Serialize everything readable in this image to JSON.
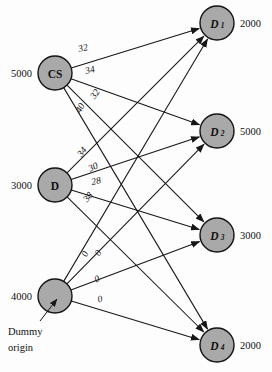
{
  "figure": {
    "type": "network-diagram",
    "background_color": "#fdfdfd",
    "node_fill_color": "#a9a9a9",
    "node_stroke_color": "#141414",
    "edge_color": "#161616"
  },
  "origins": [
    {
      "id": "CS",
      "label": "CS",
      "label_style": "upright",
      "supply": "5000",
      "cx": 55,
      "cy": 73,
      "r": 17
    },
    {
      "id": "D",
      "label": "D",
      "label_style": "upright",
      "supply": "3000",
      "cx": 55,
      "cy": 185,
      "r": 17
    },
    {
      "id": "DUMMY",
      "label": "",
      "label_style": "none",
      "supply": "4000",
      "cx": 55,
      "cy": 296,
      "r": 17
    }
  ],
  "destinations": [
    {
      "id": "D1",
      "label": "D",
      "subscript": "1",
      "demand": "2000",
      "cx": 217,
      "cy": 23,
      "r": 17
    },
    {
      "id": "D2",
      "label": "D",
      "subscript": "2",
      "demand": "5000",
      "cx": 217,
      "cy": 131,
      "r": 17
    },
    {
      "id": "D3",
      "label": "D",
      "subscript": "3",
      "demand": "3000",
      "cx": 217,
      "cy": 235,
      "r": 17
    },
    {
      "id": "D4",
      "label": "D",
      "subscript": "4",
      "demand": "2000",
      "cx": 217,
      "cy": 345,
      "r": 17
    }
  ],
  "edges": [
    {
      "from": "CS",
      "to": "D1",
      "cost": "32",
      "lx": 83,
      "ly": 48,
      "rot": -13
    },
    {
      "from": "CS",
      "to": "D2",
      "cost": "34",
      "lx": 90,
      "ly": 70,
      "rot": -14
    },
    {
      "from": "CS",
      "to": "D3",
      "cost": "32",
      "lx": 95,
      "ly": 94,
      "rot": -56
    },
    {
      "from": "CS",
      "to": "D4",
      "cost": "40",
      "lx": 80,
      "ly": 108,
      "rot": -62
    },
    {
      "from": "D",
      "to": "D1",
      "cost": "34",
      "lx": 82,
      "ly": 152,
      "rot": -52
    },
    {
      "from": "D",
      "to": "D2",
      "cost": "30",
      "lx": 93,
      "ly": 167,
      "rot": -24
    },
    {
      "from": "D",
      "to": "D3",
      "cost": "28",
      "lx": 96,
      "ly": 181,
      "rot": -13
    },
    {
      "from": "D",
      "to": "D4",
      "cost": "38",
      "lx": 88,
      "ly": 197,
      "rot": -50
    },
    {
      "from": "DUMMY",
      "to": "D1",
      "cost": "0",
      "lx": 85,
      "ly": 254,
      "rot": -67
    },
    {
      "from": "DUMMY",
      "to": "D2",
      "cost": "0",
      "lx": 98,
      "ly": 253,
      "rot": -60
    },
    {
      "from": "DUMMY",
      "to": "D3",
      "cost": "0",
      "lx": 97,
      "ly": 279,
      "rot": -27
    },
    {
      "from": "DUMMY",
      "to": "D4",
      "cost": "0",
      "lx": 100,
      "ly": 299,
      "rot": -12
    }
  ],
  "annotation": {
    "line1": "Dummy",
    "line2": "origin",
    "text_x": 8,
    "text_y1": 331,
    "text_y2": 347,
    "arrow_from_x": 40,
    "arrow_from_y": 321,
    "arrow_to_x": 57,
    "arrow_to_y": 299
  }
}
